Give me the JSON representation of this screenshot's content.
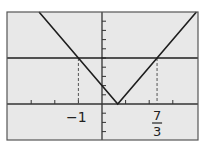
{
  "colors": {
    "background": "#ffffff",
    "plot_area": "#e8e8e8",
    "frame": "#555555",
    "axes": "#333333",
    "curve": "#1e1e1e",
    "dashed": "#555555"
  },
  "chart_data": {
    "type": "line",
    "title": "",
    "xlabel": "",
    "ylabel": "",
    "xlim": [
      -4,
      4
    ],
    "ylim": [
      -4,
      10
    ],
    "grid": false,
    "xticks_step": 1,
    "yticks_step": 1,
    "series": [
      {
        "name": "y = |3x - 2|",
        "kind": "v-shape",
        "x": [
          -2.67,
          0.667,
          4
        ],
        "y": [
          10,
          0,
          10
        ]
      },
      {
        "name": "y = 5",
        "kind": "horizontal-line",
        "x": [
          -4,
          4
        ],
        "y": [
          5,
          5
        ]
      }
    ],
    "annotations": [
      {
        "type": "dashed-vertical",
        "x": -1,
        "y_from": 0,
        "y_to": 5,
        "label": "-1"
      },
      {
        "type": "dashed-vertical",
        "x": 2.333,
        "y_from": 0,
        "y_to": 5,
        "label_num": "7",
        "label_den": "3"
      }
    ],
    "tick_labels": [
      {
        "x": -1,
        "text": "−1"
      },
      {
        "x": 2.333,
        "text": "7/3"
      }
    ]
  },
  "labels": {
    "neg_one": "−1",
    "frac_num": "7",
    "frac_den": "3"
  }
}
